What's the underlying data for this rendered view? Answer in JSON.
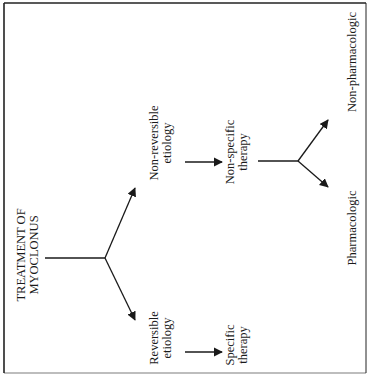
{
  "diagram": {
    "title_line1": "TREATMENT OF",
    "title_line2": "MYOCLONUS",
    "orientation": "rotated 90° counter-clockwise",
    "nodes": {
      "non_reversible": {
        "line1": "Non-reversible",
        "line2": "etiology"
      },
      "reversible": {
        "line1": "Reversible",
        "line2": "etiology"
      },
      "non_specific": {
        "line1": "Non-specific",
        "line2": "therapy"
      },
      "specific": {
        "line1": "Specific",
        "line2": "therapy"
      },
      "non_pharmacologic": {
        "label": "Non-pharmacologic"
      },
      "pharmacologic": {
        "label": "Pharmacologic"
      }
    },
    "edges": [
      {
        "from": "TREATMENT OF MYOCLONUS",
        "to": "Non-reversible etiology"
      },
      {
        "from": "TREATMENT OF MYOCLONUS",
        "to": "Reversible etiology"
      },
      {
        "from": "Non-reversible etiology",
        "to": "Non-specific therapy"
      },
      {
        "from": "Reversible etiology",
        "to": "Specific therapy"
      },
      {
        "from": "Non-specific therapy",
        "to": "Non-pharmacologic"
      },
      {
        "from": "Non-specific therapy",
        "to": "Pharmacologic"
      }
    ],
    "colors": {
      "ink": "#1a1a1a",
      "background": "#ffffff"
    }
  }
}
